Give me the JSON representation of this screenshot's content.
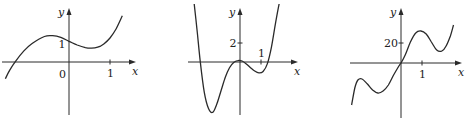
{
  "chart_data": [
    {
      "type": "line",
      "title": "",
      "xlabel": "x",
      "ylabel": "y",
      "x_ticks": [
        {
          "value": 1,
          "label": "1"
        }
      ],
      "y_ticks": [
        {
          "value": 1,
          "label": "1"
        }
      ],
      "origin_label": "0",
      "xlim": [
        -1.55,
        1.35
      ],
      "ylim": [
        -1.4,
        2.1
      ],
      "grid": false,
      "series": [
        {
          "name": "curve",
          "x": [
            -1.55,
            -1.45,
            -1.3,
            -1.1,
            -0.9,
            -0.6,
            -0.4,
            -0.2,
            0,
            0.2,
            0.4,
            0.55,
            0.7,
            0.85,
            1.0,
            1.15,
            1.3
          ],
          "y": [
            -0.9,
            -0.45,
            0.05,
            0.6,
            1.0,
            1.38,
            1.42,
            1.33,
            1.12,
            0.92,
            0.78,
            0.75,
            0.8,
            0.98,
            1.3,
            1.8,
            2.5
          ]
        }
      ]
    },
    {
      "type": "line",
      "title": "",
      "xlabel": "x",
      "ylabel": "y",
      "x_ticks": [
        {
          "value": 1,
          "label": "1"
        }
      ],
      "y_ticks": [
        {
          "value": 2,
          "label": "2"
        }
      ],
      "xlim": [
        -2.6,
        2.2
      ],
      "ylim": [
        -6,
        7
      ],
      "grid": false,
      "series": [
        {
          "name": "curve",
          "x": [
            -2.2,
            -2.05,
            -1.9,
            -1.7,
            -1.5,
            -1.3,
            -1.1,
            -0.9,
            -0.7,
            -0.5,
            -0.3,
            -0.1,
            0.1,
            0.3,
            0.5,
            0.7,
            0.9,
            1.1,
            1.3,
            1.5,
            1.7,
            1.9,
            2.05
          ],
          "y": [
            6.5,
            3.5,
            0.2,
            -3.2,
            -4.9,
            -5.3,
            -4.4,
            -3.0,
            -1.6,
            -0.6,
            -0.05,
            0.15,
            0.1,
            -0.2,
            -0.6,
            -0.95,
            -1.15,
            -1.0,
            -0.2,
            1.6,
            4.2,
            6.5,
            7.5
          ]
        }
      ]
    },
    {
      "type": "line",
      "title": "",
      "xlabel": "x",
      "ylabel": "y",
      "x_ticks": [
        {
          "value": 1,
          "label": "1"
        }
      ],
      "y_ticks": [
        {
          "value": 20,
          "label": "20"
        }
      ],
      "xlim": [
        -2.5,
        2.6
      ],
      "ylim": [
        -45,
        40
      ],
      "grid": false,
      "series": [
        {
          "name": "curve",
          "x": [
            -2.35,
            -2.2,
            -2.05,
            -1.85,
            -1.6,
            -1.35,
            -1.1,
            -0.85,
            -0.6,
            -0.35,
            -0.1,
            0,
            0.2,
            0.45,
            0.7,
            0.95,
            1.2,
            1.45,
            1.7,
            1.95,
            2.15,
            2.35,
            2.5
          ],
          "y": [
            -42,
            -25,
            -17,
            -16,
            -21,
            -27,
            -30,
            -28,
            -22,
            -12,
            -3,
            0,
            8,
            21,
            30,
            32,
            29,
            21,
            13,
            12,
            17,
            27,
            38
          ]
        }
      ]
    }
  ]
}
